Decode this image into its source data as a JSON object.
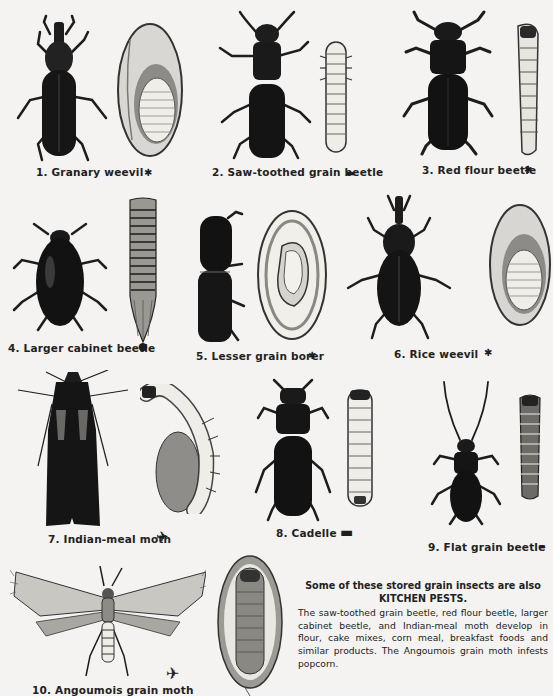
{
  "plate": {
    "title": "Stored grain insects",
    "insects": [
      {
        "number": "1.",
        "name": "Granary weevil",
        "label": "1.  Granary weevil"
      },
      {
        "number": "2.",
        "name": "Saw-toothed grain beetle",
        "label": "2. Saw-toothed grain beetle"
      },
      {
        "number": "3.",
        "name": "Red flour beetle",
        "label": "3.  Red flour beetle"
      },
      {
        "number": "4.",
        "name": "Larger cabinet beetle",
        "label": "4.  Larger cabinet beetle"
      },
      {
        "number": "5.",
        "name": "Lesser grain borer",
        "label": "5.  Lesser grain borer"
      },
      {
        "number": "6.",
        "name": "Rice weevil",
        "label": "6.  Rice weevil"
      },
      {
        "number": "7.",
        "name": "Indian-meal moth",
        "label": "7.  Indian-meal moth"
      },
      {
        "number": "8.",
        "name": "Cadelle",
        "label": "8.  Cadelle"
      },
      {
        "number": "9.",
        "name": "Flat grain beetle",
        "label": "9.  Flat grain beetle"
      },
      {
        "number": "10.",
        "name": "Angoumois grain moth",
        "label": "10.  Angoumois grain moth"
      }
    ]
  },
  "caption": {
    "heading_line1": "Some of these stored grain insects are also",
    "heading_line2": "KITCHEN PESTS.",
    "body": "The saw-toothed grain beetle, red flour beetle, larger cabinet beetle, and Indian-meal moth develop in flour, cake mixes, corn meal, breakfast foods and similar products.  The Angoumois grain moth infests popcorn."
  },
  "colors": {
    "paper": "#f4f3f1",
    "ink": "#1d1d1d",
    "grain": "#d8d6d2",
    "larva": "#efede8"
  }
}
